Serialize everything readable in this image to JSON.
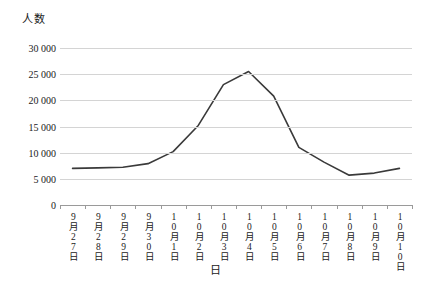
{
  "chart_data": {
    "type": "line",
    "title": "",
    "xlabel": "日",
    "ylabel": "人数",
    "ylim": [
      0,
      30000
    ],
    "ytick_labels": [
      "30 000",
      "25 000",
      "20 000",
      "15 000",
      "10 000",
      "5 000",
      "0"
    ],
    "ytick_values": [
      30000,
      25000,
      20000,
      15000,
      10000,
      5000,
      0
    ],
    "grid": true,
    "legend": "none",
    "line_color": "#3a3a3a",
    "grid_color": "#d4d4d4",
    "categories": [
      "9月27日",
      "9月28日",
      "9月29日",
      "9月30日",
      "10月1日",
      "10月2日",
      "10月3日",
      "10月4日",
      "10月5日",
      "10月6日",
      "10月7日",
      "10月8日",
      "10月9日",
      "10月10日"
    ],
    "values": [
      7000,
      7100,
      7200,
      7900,
      10200,
      15200,
      23000,
      25500,
      20800,
      11000,
      8200,
      5700,
      6100,
      7000
    ]
  }
}
